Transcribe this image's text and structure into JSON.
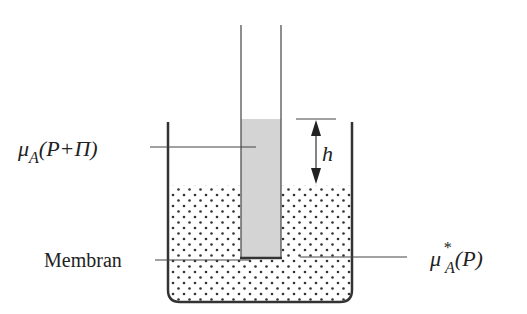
{
  "diagram": {
    "type": "osmosis-apparatus",
    "labels": {
      "inner_potential": {
        "mu": "μ",
        "sub": "A",
        "arg": "(P+Π)"
      },
      "outer_potential": {
        "mu": "μ",
        "sup": "*",
        "sub": "A",
        "arg": "(P)"
      },
      "membrane": "Membran",
      "height": "h"
    },
    "colors": {
      "line": "#333333",
      "tube_fill": "#d4d4d4",
      "dots": "#333333",
      "background": "#ffffff"
    }
  }
}
